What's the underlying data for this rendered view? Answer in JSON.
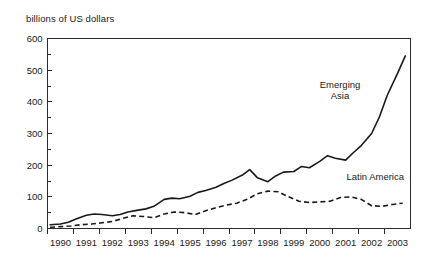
{
  "caption": "billions of US dollars",
  "annotations": {
    "emerging_asia_line1": "Emerging",
    "emerging_asia_line2": "Asia",
    "latin_america": "Latin America"
  },
  "chart_data": {
    "type": "line",
    "title": "",
    "subtitle": "",
    "xlabel": "",
    "ylabel": "billions of US dollars",
    "ylim": [
      0,
      600
    ],
    "xlim": [
      1989.5,
      2003.5
    ],
    "yticks": [
      0,
      100,
      200,
      300,
      400,
      500,
      600
    ],
    "yticks_minor": [
      50,
      150,
      250,
      350,
      450,
      550
    ],
    "grid": false,
    "legend_position": "inline-annotation",
    "categories": [
      1990,
      1991,
      1992,
      1993,
      1994,
      1995,
      1996,
      1997,
      1998,
      1999,
      2000,
      2001,
      2002,
      2003
    ],
    "xticklabels": [
      "1990",
      "1991",
      "1992",
      "1993",
      "1994",
      "1995",
      "1996",
      "1997",
      "1998",
      "1999",
      "2000",
      "2001",
      "2002",
      "2003"
    ],
    "series": [
      {
        "name": "Emerging Asia",
        "style": "solid",
        "color": "#1a1a1a",
        "x": [
          1989.6,
          1990.0,
          1990.3,
          1990.6,
          1991.0,
          1991.3,
          1991.6,
          1992.0,
          1992.3,
          1992.6,
          1993.0,
          1993.3,
          1993.6,
          1994.0,
          1994.3,
          1994.6,
          1995.0,
          1995.3,
          1995.6,
          1996.0,
          1996.3,
          1996.6,
          1997.0,
          1997.3,
          1997.6,
          1998.0,
          1998.3,
          1998.6,
          1999.0,
          1999.3,
          1999.6,
          2000.0,
          2000.3,
          2000.6,
          2001.0,
          2001.3,
          2001.6,
          2002.0,
          2002.3,
          2002.6,
          2003.0,
          2003.3
        ],
        "values": [
          12,
          14,
          20,
          30,
          42,
          46,
          44,
          40,
          44,
          52,
          58,
          62,
          70,
          92,
          96,
          94,
          102,
          114,
          120,
          130,
          142,
          152,
          168,
          186,
          160,
          148,
          166,
          178,
          180,
          196,
          192,
          212,
          230,
          222,
          216,
          240,
          262,
          300,
          352,
          420,
          490,
          545
        ]
      },
      {
        "name": "Latin America",
        "style": "dashed",
        "color": "#1a1a1a",
        "x": [
          1989.6,
          1990.0,
          1990.4,
          1990.8,
          1991.2,
          1991.6,
          1992.0,
          1992.4,
          1992.8,
          1993.2,
          1993.6,
          1994.0,
          1994.4,
          1994.8,
          1995.2,
          1995.6,
          1996.0,
          1996.4,
          1996.8,
          1997.2,
          1997.6,
          1998.0,
          1998.4,
          1998.8,
          1999.2,
          1999.6,
          2000.0,
          2000.4,
          2000.8,
          2001.2,
          2001.6,
          2002.0,
          2002.4,
          2002.8,
          2003.2
        ],
        "values": [
          4,
          6,
          8,
          12,
          14,
          18,
          22,
          32,
          40,
          38,
          34,
          46,
          52,
          50,
          44,
          56,
          66,
          74,
          80,
          92,
          110,
          118,
          116,
          100,
          86,
          82,
          84,
          86,
          98,
          100,
          92,
          72,
          70,
          76,
          80
        ]
      }
    ]
  }
}
